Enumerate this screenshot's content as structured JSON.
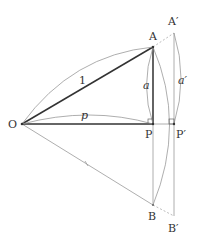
{
  "diagram": {
    "points": {
      "O": {
        "label": "O",
        "x": 22,
        "y": 124
      },
      "A": {
        "label": "A",
        "x": 153,
        "y": 47
      },
      "A_prime": {
        "label": "A′",
        "x": 174,
        "y": 33
      },
      "P": {
        "label": "P",
        "x": 153,
        "y": 124
      },
      "P_prime": {
        "label": "P′",
        "x": 174,
        "y": 124
      },
      "B": {
        "label": "B",
        "x": 153,
        "y": 205
      },
      "B_prime": {
        "label": "B′",
        "x": 174,
        "y": 216
      }
    },
    "measures": {
      "OA": "1",
      "OP": "p",
      "AP": "a",
      "A_prime_P_prime": "a′"
    },
    "colors": {
      "thick_line": "#333333",
      "thin_line": "#999999",
      "dashed_line": "#aaaaaa",
      "label": "#333333"
    }
  }
}
